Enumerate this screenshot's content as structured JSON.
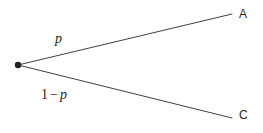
{
  "diagram": {
    "type": "probability-branch",
    "background_color": "#ffffff",
    "stroke_color": "#3f3f46",
    "text_color": "#231f20",
    "vertex": {
      "name": "decision-node",
      "x": 18,
      "y": 65,
      "radius": 3,
      "fill": "#231f20"
    },
    "branches": [
      {
        "id": "upper",
        "label": "p",
        "from": {
          "x": 18,
          "y": 65
        },
        "to": {
          "x": 232,
          "y": 14
        },
        "endpoint_label": "A"
      },
      {
        "id": "lower",
        "label": "1 − p",
        "label_parts": {
          "number": "1",
          "operator": "−",
          "variable": "p"
        },
        "from": {
          "x": 18,
          "y": 65
        },
        "to": {
          "x": 232,
          "y": 118
        },
        "endpoint_label": "C"
      }
    ],
    "node_labels": {
      "a": "A",
      "c": "C"
    }
  }
}
